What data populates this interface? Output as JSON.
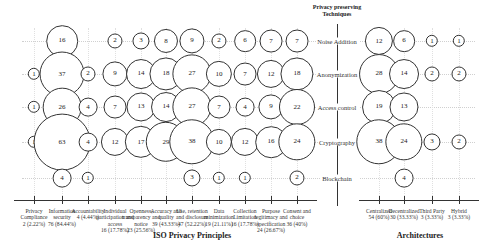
{
  "chart_data": {
    "type": "bubble",
    "title": "",
    "y_axis_title": "Privacy preserving Techniques",
    "techniques": [
      "Noise Addition",
      "Anonymization",
      "Access control",
      "Cryptography",
      "Blockchain"
    ],
    "groups": [
      {
        "name": "ISO Privacy Principles",
        "categories": [
          {
            "label": "Privacy Compliance",
            "count": "2 (2.22%)"
          },
          {
            "label": "Information security",
            "count": "76 (84.44%)"
          },
          {
            "label": "Accountability",
            "count": "4 (4.44%)"
          },
          {
            "label": "Individual participation and access",
            "count": "16 (17.78%)"
          },
          {
            "label": "Openness, transparency and notice",
            "count": "23 (25.56%)"
          },
          {
            "label": "Accuracy and quality",
            "count": "39 (43.33%)"
          },
          {
            "label": "Use, retention and disclosure",
            "count": "47 (52.22%)"
          },
          {
            "label": "Data minimization",
            "count": "19 (21.11%)"
          },
          {
            "label": "Collection Limitation",
            "count": "16 (17.78%)"
          },
          {
            "label": "Purpose legitimacy and specification",
            "count": "24 (26.67%)"
          },
          {
            "label": "Consent and choice",
            "count": "36 (40%)"
          }
        ],
        "values": {
          "Noise Addition": [
            null,
            16,
            null,
            2,
            3,
            8,
            9,
            2,
            6,
            7,
            7
          ],
          "Anonymization": [
            1,
            37,
            2,
            9,
            14,
            18,
            27,
            10,
            7,
            12,
            18
          ],
          "Access control": [
            1,
            26,
            4,
            7,
            13,
            14,
            27,
            7,
            4,
            9,
            22
          ],
          "Cryptography": [
            1,
            63,
            4,
            12,
            17,
            29,
            38,
            10,
            12,
            16,
            24
          ],
          "Blockchain": [
            null,
            4,
            1,
            null,
            null,
            null,
            3,
            1,
            1,
            null,
            2
          ]
        }
      },
      {
        "name": "Architectures",
        "categories": [
          {
            "label": "Centralized",
            "count": "54 (60%)"
          },
          {
            "label": "Decentralized",
            "count": "30 (33.33%)"
          },
          {
            "label": "Third Party",
            "count": "3 (3.33%)"
          },
          {
            "label": "Hybrid",
            "count": "3 (3.33%)"
          }
        ],
        "values": {
          "Noise Addition": [
            12,
            6,
            1,
            1
          ],
          "Anonymization": [
            28,
            14,
            2,
            2
          ],
          "Access control": [
            19,
            13,
            null,
            null
          ],
          "Cryptography": [
            38,
            24,
            3,
            2
          ],
          "Blockchain": [
            null,
            4,
            null,
            null
          ]
        }
      }
    ],
    "xlabel_left": "ISO Privacy Principles",
    "xlabel_right": "Architectures",
    "grid": true,
    "legend": null
  }
}
